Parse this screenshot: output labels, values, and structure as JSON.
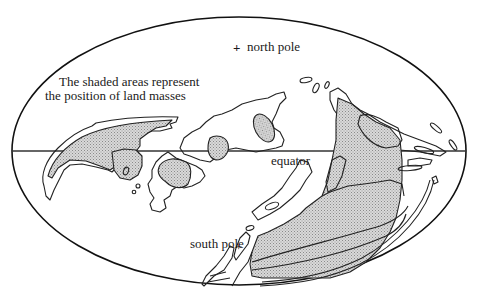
{
  "diagram": {
    "type": "world-map-projection",
    "projection": "elliptical (Mollweide-style) whole-globe outline",
    "annotation": {
      "line1": "The shaded areas represent",
      "line2": "the position of land masses"
    },
    "labels": {
      "north_pole": "north pole",
      "south_pole": "south pole",
      "equator": "equator"
    },
    "markers": {
      "north_pole_symbol": "+",
      "south_pole_symbol": "+"
    },
    "legend": {
      "shaded": "land masses",
      "outline": "present-day continental outlines"
    },
    "colors": {
      "ink": "#222222",
      "shade": "#c8c8c8",
      "background": "#ffffff"
    }
  }
}
